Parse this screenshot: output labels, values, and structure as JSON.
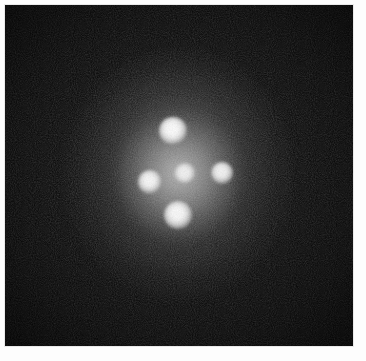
{
  "figure": {
    "kind": "astronomical-image",
    "caption": "",
    "frame": {
      "margin_color": "#ffffff",
      "plate_background": "#050505",
      "plate_left": 5,
      "plate_top": 5,
      "plate_width": 348,
      "plate_height": 341
    }
  },
  "chart_data": {
    "type": "scatter",
    "subtitle": "",
    "xlabel": "",
    "ylabel": "",
    "xlim": [
      0,
      348
    ],
    "ylim": [
      0,
      341
    ],
    "grid": false,
    "legend": "none",
    "background": "#050505",
    "annotations": [],
    "tick_labels": {
      "x": [],
      "y": []
    },
    "halo": {
      "name": "lensing-galaxy-halo",
      "center_x": 174,
      "center_y": 170,
      "width": 230,
      "height": 250,
      "peak_brightness": 0.58
    },
    "series": [
      {
        "name": "lensed point sources",
        "points": [
          {
            "label": "A",
            "role": "quasar-image-top",
            "x": 168,
            "y": 126,
            "radius": 14,
            "brightness": 1.0
          },
          {
            "label": "B",
            "role": "quasar-image-left",
            "x": 145,
            "y": 177,
            "radius": 12,
            "brightness": 0.96
          },
          {
            "label": "C",
            "role": "quasar-image-right",
            "x": 217,
            "y": 168,
            "radius": 11,
            "brightness": 0.94
          },
          {
            "label": "D",
            "role": "quasar-image-bottom",
            "x": 173,
            "y": 210,
            "radius": 14,
            "brightness": 0.98
          },
          {
            "label": "G",
            "role": "lens-galaxy-nucleus",
            "x": 180,
            "y": 169,
            "radius": 11,
            "brightness": 0.88
          }
        ]
      }
    ]
  }
}
